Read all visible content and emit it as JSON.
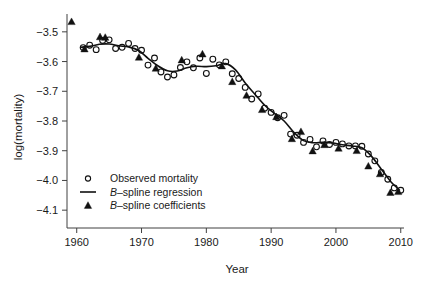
{
  "chart_data": {
    "type": "scatter",
    "title": "",
    "xlabel": "Year",
    "ylabel": "log(mortality)",
    "xlim": [
      1958.5,
      2010.5
    ],
    "ylim": [
      -4.16,
      -3.44
    ],
    "xticks": [
      1960,
      1970,
      1980,
      1990,
      2000,
      2010
    ],
    "xtick_labels": [
      "1960",
      "1970",
      "1980",
      "1990",
      "2000",
      "2010"
    ],
    "yticks": [
      -3.5,
      -3.6,
      -3.7,
      -3.8,
      -3.9,
      -4.0,
      -4.1
    ],
    "ytick_labels": [
      "−3.5",
      "−3.6",
      "−3.7",
      "−3.8",
      "−3.9",
      "−4.0",
      "−4.1"
    ],
    "grid": false,
    "legend_position": "bottom-left",
    "series": [
      {
        "name": "Observed mortality",
        "marker": "open-circle",
        "type": "scatter",
        "points": [
          [
            1961,
            -3.553
          ],
          [
            1962,
            -3.545
          ],
          [
            1963,
            -3.56
          ],
          [
            1964,
            -3.529
          ],
          [
            1965,
            -3.527
          ],
          [
            1966,
            -3.556
          ],
          [
            1967,
            -3.552
          ],
          [
            1968,
            -3.539
          ],
          [
            1969,
            -3.556
          ],
          [
            1970,
            -3.562
          ],
          [
            1971,
            -3.612
          ],
          [
            1972,
            -3.588
          ],
          [
            1973,
            -3.635
          ],
          [
            1974,
            -3.652
          ],
          [
            1975,
            -3.645
          ],
          [
            1976,
            -3.62
          ],
          [
            1977,
            -3.601
          ],
          [
            1978,
            -3.621
          ],
          [
            1979,
            -3.588
          ],
          [
            1980,
            -3.64
          ],
          [
            1981,
            -3.592
          ],
          [
            1982,
            -3.611
          ],
          [
            1983,
            -3.601
          ],
          [
            1984,
            -3.641
          ],
          [
            1985,
            -3.657
          ],
          [
            1986,
            -3.687
          ],
          [
            1987,
            -3.726
          ],
          [
            1988,
            -3.709
          ],
          [
            1989,
            -3.757
          ],
          [
            1990,
            -3.771
          ],
          [
            1991,
            -3.789
          ],
          [
            1992,
            -3.781
          ],
          [
            1993,
            -3.844
          ],
          [
            1994,
            -3.848
          ],
          [
            1995,
            -3.872
          ],
          [
            1996,
            -3.862
          ],
          [
            1997,
            -3.887
          ],
          [
            1998,
            -3.867
          ],
          [
            1999,
            -3.879
          ],
          [
            2000,
            -3.872
          ],
          [
            2001,
            -3.877
          ],
          [
            2002,
            -3.884
          ],
          [
            2003,
            -3.884
          ],
          [
            2004,
            -3.885
          ],
          [
            2005,
            -3.911
          ],
          [
            2006,
            -3.934
          ],
          [
            2007,
            -3.973
          ],
          [
            2008,
            -3.996
          ],
          [
            2009,
            -4.025
          ],
          [
            2010,
            -4.033
          ]
        ]
      },
      {
        "name": "B–spline regression",
        "marker": "line",
        "type": "line",
        "points": [
          [
            1960.6,
            -3.552
          ],
          [
            1962.0,
            -3.549
          ],
          [
            1963.5,
            -3.542
          ],
          [
            1965.0,
            -3.541
          ],
          [
            1966.5,
            -3.547
          ],
          [
            1968.0,
            -3.551
          ],
          [
            1969.5,
            -3.562
          ],
          [
            1971.0,
            -3.589
          ],
          [
            1972.5,
            -3.614
          ],
          [
            1974.0,
            -3.631
          ],
          [
            1975.5,
            -3.632
          ],
          [
            1977.0,
            -3.621
          ],
          [
            1978.5,
            -3.616
          ],
          [
            1980.0,
            -3.617
          ],
          [
            1981.5,
            -3.614
          ],
          [
            1983.0,
            -3.607
          ],
          [
            1984.5,
            -3.628
          ],
          [
            1986.0,
            -3.672
          ],
          [
            1987.5,
            -3.71
          ],
          [
            1989.0,
            -3.747
          ],
          [
            1990.5,
            -3.774
          ],
          [
            1992.0,
            -3.8
          ],
          [
            1993.5,
            -3.838
          ],
          [
            1995.0,
            -3.866
          ],
          [
            1996.5,
            -3.873
          ],
          [
            1998.0,
            -3.872
          ],
          [
            1999.5,
            -3.874
          ],
          [
            2001.0,
            -3.88
          ],
          [
            2002.5,
            -3.884
          ],
          [
            2004.0,
            -3.89
          ],
          [
            2005.5,
            -3.919
          ],
          [
            2007.0,
            -3.962
          ],
          [
            2008.5,
            -4.005
          ],
          [
            2009.8,
            -4.032
          ]
        ]
      },
      {
        "name": "B–spline coefficients",
        "marker": "filled-triangle",
        "type": "scatter",
        "points": [
          [
            1959.2,
            -3.466
          ],
          [
            1961.2,
            -3.558
          ],
          [
            1963.6,
            -3.517
          ],
          [
            1964.4,
            -3.519
          ],
          [
            1969.6,
            -3.586
          ],
          [
            1972.2,
            -3.623
          ],
          [
            1976.2,
            -3.595
          ],
          [
            1979.4,
            -3.575
          ],
          [
            1982.4,
            -3.615
          ],
          [
            1984.0,
            -3.668
          ],
          [
            1986.2,
            -3.714
          ],
          [
            1988.6,
            -3.762
          ],
          [
            1990.8,
            -3.786
          ],
          [
            1993.2,
            -3.86
          ],
          [
            1994.6,
            -3.836
          ],
          [
            1996.4,
            -3.901
          ],
          [
            1998.2,
            -3.88
          ],
          [
            2000.4,
            -3.892
          ],
          [
            2003.2,
            -3.9
          ],
          [
            2005.0,
            -3.952
          ],
          [
            2006.8,
            -3.978
          ],
          [
            2008.4,
            -4.041
          ],
          [
            2009.6,
            -4.038
          ]
        ]
      }
    ],
    "legend": [
      {
        "label": "Observed mortality",
        "marker": "open-circle",
        "italic_prefix": ""
      },
      {
        "label": "–spline regression",
        "marker": "line",
        "italic_prefix": "B"
      },
      {
        "label": "–spline coefficients",
        "marker": "filled-triangle",
        "italic_prefix": "B"
      }
    ],
    "colors": {
      "line": "#111111",
      "marker": "#111111",
      "axis": "#404040",
      "background": "#ffffff"
    }
  }
}
